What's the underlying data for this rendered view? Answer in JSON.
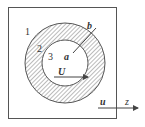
{
  "diagram": {
    "type": "coaxial-region-cross-section",
    "regions": [
      {
        "id": "region-1",
        "label": "1",
        "description": "outer region"
      },
      {
        "id": "region-2",
        "label": "2",
        "description": "hatched annulus between radii a and b"
      },
      {
        "id": "region-3",
        "label": "3",
        "description": "inner circular region"
      }
    ],
    "radii": {
      "inner": "a",
      "outer": "b"
    },
    "velocities": {
      "inner": "U",
      "outer": "u"
    },
    "axis": "z",
    "colors": {
      "line": "#555555",
      "hatch": "#777777",
      "text": "#333333",
      "background": "#ffffff"
    }
  }
}
